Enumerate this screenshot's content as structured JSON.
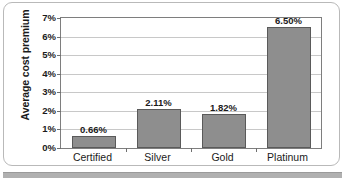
{
  "chart_data": {
    "type": "bar",
    "title": "",
    "xlabel": "",
    "ylabel": "Average cost premium",
    "categories": [
      "Certified",
      "Silver",
      "Gold",
      "Platinum"
    ],
    "values": [
      0.66,
      2.11,
      1.82,
      6.5
    ],
    "data_labels": [
      "0.66%",
      "2.11%",
      "1.82%",
      "6.50%"
    ],
    "ylim": [
      0,
      7
    ],
    "ytick_labels": [
      "0%",
      "1%",
      "2%",
      "3%",
      "4%",
      "5%",
      "6%",
      "7%"
    ],
    "ytick_values": [
      0,
      1,
      2,
      3,
      4,
      5,
      6,
      7
    ],
    "grid": true,
    "legend": "none",
    "series": [
      {
        "name": "Average cost premium",
        "values": [
          0.66,
          2.11,
          1.82,
          6.5
        ]
      }
    ],
    "colors": {
      "bar_fill": "#8e8e8e",
      "bar_border": "#5a5a5a",
      "gridline": "#c8c8c8",
      "axis": "#7e7e7e",
      "text": "#1b1b1b",
      "plot_background": "#ffffff",
      "frame_border": "#b9b9b9",
      "divider": "#b0b0b0"
    }
  }
}
